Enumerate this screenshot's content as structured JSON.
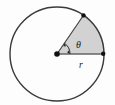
{
  "figure": {
    "background_color": "#fdfdfd",
    "stroke_color": "#3a3a3a",
    "sector_fill_color": "#d2d2d2",
    "sector_stroke_color": "#707070",
    "point_color": "#111111",
    "labels": {
      "angle": "θ",
      "radius": "r"
    },
    "geometry": {
      "center_x": 57,
      "center_y": 54,
      "radius": 47,
      "sector_start_angle_deg": 0,
      "sector_end_angle_deg": 56,
      "angle_marker_radius": 13
    },
    "points": [
      {
        "name": "center-point",
        "x": 57,
        "y": 54
      },
      {
        "name": "arc-start-point",
        "x": 104,
        "y": 54
      },
      {
        "name": "arc-end-point",
        "x": 83,
        "y": 15
      }
    ],
    "label_positions": {
      "angle_x": 76,
      "angle_y": 48,
      "radius_x": 79,
      "radius_y": 68
    }
  }
}
